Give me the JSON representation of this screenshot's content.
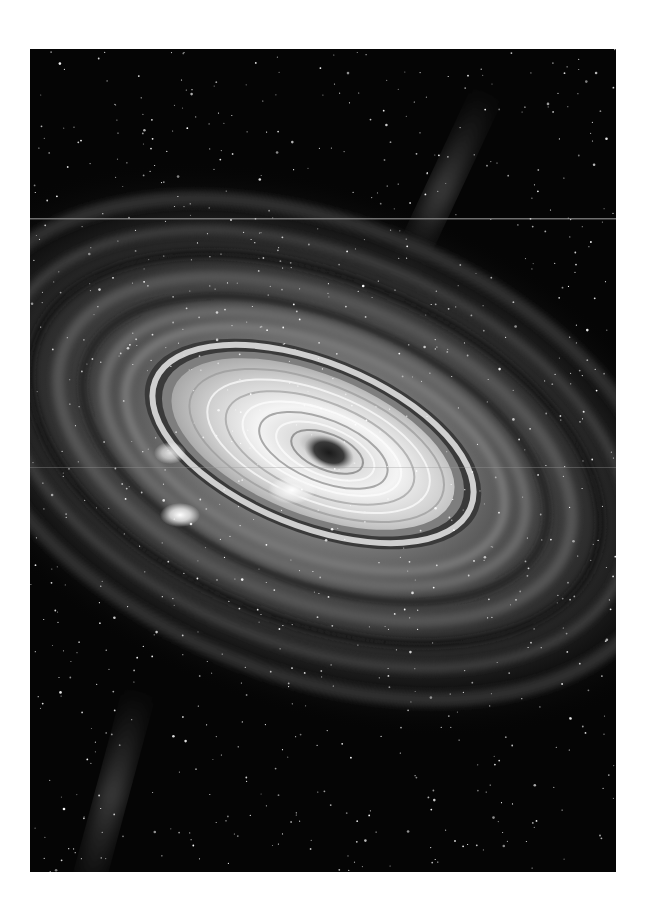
{
  "image": {
    "subject": "Black hole accretion disk with surrounding spiral galaxy and starfield",
    "palette": {
      "space": "#050505",
      "disk_glow": "#f2f2f2",
      "mid_arms": "#6a6a6a",
      "outer_arms": "#2a2a2a",
      "core": "#2b2b2b"
    }
  }
}
